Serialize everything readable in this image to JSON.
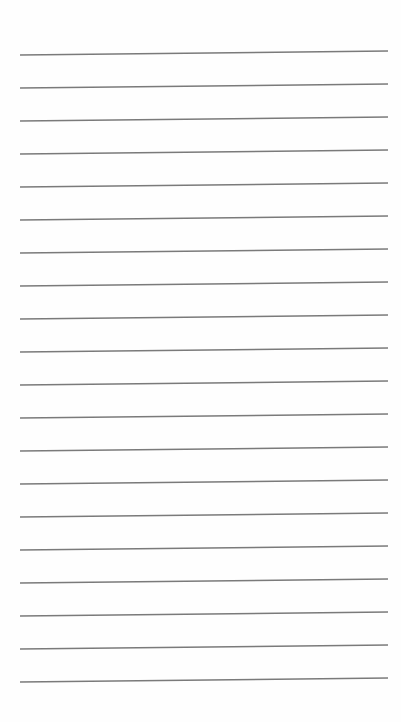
{
  "page": {
    "type": "lined-paper",
    "background": "#fefefe",
    "line_color": "#7a7a7a",
    "line_count": 20,
    "lines": [
      {
        "x1": 20,
        "y1": 55,
        "x2": 388,
        "y2": 51
      },
      {
        "x1": 20,
        "y1": 88,
        "x2": 388,
        "y2": 84
      },
      {
        "x1": 20,
        "y1": 121,
        "x2": 388,
        "y2": 117
      },
      {
        "x1": 20,
        "y1": 154,
        "x2": 388,
        "y2": 150
      },
      {
        "x1": 20,
        "y1": 187,
        "x2": 388,
        "y2": 183
      },
      {
        "x1": 20,
        "y1": 220,
        "x2": 388,
        "y2": 216
      },
      {
        "x1": 20,
        "y1": 253,
        "x2": 388,
        "y2": 249
      },
      {
        "x1": 20,
        "y1": 286,
        "x2": 388,
        "y2": 282
      },
      {
        "x1": 20,
        "y1": 319,
        "x2": 388,
        "y2": 315
      },
      {
        "x1": 20,
        "y1": 352,
        "x2": 388,
        "y2": 348
      },
      {
        "x1": 20,
        "y1": 385,
        "x2": 388,
        "y2": 381
      },
      {
        "x1": 20,
        "y1": 418,
        "x2": 388,
        "y2": 414
      },
      {
        "x1": 20,
        "y1": 451,
        "x2": 388,
        "y2": 447
      },
      {
        "x1": 20,
        "y1": 484,
        "x2": 388,
        "y2": 480
      },
      {
        "x1": 20,
        "y1": 517,
        "x2": 388,
        "y2": 513
      },
      {
        "x1": 20,
        "y1": 550,
        "x2": 388,
        "y2": 546
      },
      {
        "x1": 20,
        "y1": 583,
        "x2": 388,
        "y2": 579
      },
      {
        "x1": 20,
        "y1": 616,
        "x2": 388,
        "y2": 612
      },
      {
        "x1": 20,
        "y1": 649,
        "x2": 388,
        "y2": 645
      },
      {
        "x1": 20,
        "y1": 682,
        "x2": 388,
        "y2": 678
      }
    ]
  }
}
